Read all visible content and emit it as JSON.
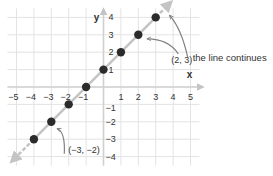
{
  "chart_data": {
    "type": "line",
    "title": "",
    "xlabel": "x",
    "ylabel": "y",
    "xlim": [
      -5,
      5
    ],
    "ylim": [
      -4,
      4
    ],
    "grid": true,
    "x_ticks": [
      -5,
      -4,
      -3,
      -2,
      -1,
      1,
      2,
      3,
      4,
      5
    ],
    "y_ticks": [
      -4,
      -3,
      -2,
      -1,
      1,
      2,
      3,
      4
    ],
    "x_tick_labels": [
      "−5",
      "−4",
      "−3",
      "−2",
      "−1",
      "1",
      "2",
      "3",
      "4",
      "5"
    ],
    "y_tick_labels": [
      "−4",
      "−3",
      "−2",
      "−1",
      "1",
      "2",
      "3",
      "4"
    ],
    "series": [
      {
        "name": "line",
        "equation": "y = x + 1",
        "x": [
          -4,
          -3,
          -2,
          -1,
          0,
          1,
          2,
          3
        ],
        "y": [
          -3,
          -2,
          -1,
          0,
          1,
          2,
          3,
          4
        ]
      }
    ],
    "annotations": [
      {
        "text": "(2, 3)",
        "point": [
          2,
          3
        ]
      },
      {
        "text": "(−3, −2)",
        "point": [
          -3,
          -2
        ]
      },
      {
        "text": "the line continues",
        "target": "upper-right arrow"
      }
    ],
    "colors": {
      "grid": "#e3e3e3",
      "axis": "#d0d0d0",
      "line": "#c4c4c4",
      "point": "#2b2b2b",
      "callout": "#808080",
      "text": "#333333"
    }
  }
}
